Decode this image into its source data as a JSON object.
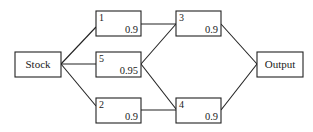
{
  "diagram": {
    "title": "",
    "nodes": {
      "stock": {
        "label": "Stock"
      },
      "output": {
        "label": "Output"
      },
      "c1": {
        "id": "1",
        "reliability": "0.9"
      },
      "c2": {
        "id": "2",
        "reliability": "0.9"
      },
      "c3": {
        "id": "3",
        "reliability": "0.9"
      },
      "c4": {
        "id": "4",
        "reliability": "0.9"
      },
      "c5": {
        "id": "5",
        "reliability": "0.95"
      }
    },
    "edges": [
      {
        "from": "Stock",
        "to": "1"
      },
      {
        "from": "Stock",
        "to": "5"
      },
      {
        "from": "Stock",
        "to": "2"
      },
      {
        "from": "1",
        "to": "3"
      },
      {
        "from": "5",
        "to": "3"
      },
      {
        "from": "5",
        "to": "4"
      },
      {
        "from": "2",
        "to": "4"
      },
      {
        "from": "3",
        "to": "Output"
      },
      {
        "from": "4",
        "to": "Output"
      }
    ],
    "colors": {
      "line": "#222222",
      "background": "#ffffff"
    }
  }
}
